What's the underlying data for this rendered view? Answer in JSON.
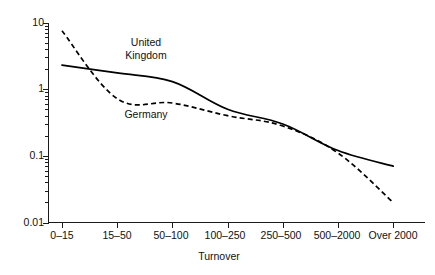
{
  "chart_data": {
    "type": "line",
    "title": "",
    "xlabel": "Turnover",
    "ylabel": "",
    "yscale": "log",
    "ylim": [
      0.01,
      10
    ],
    "grid": false,
    "legend": "inline-annotations",
    "categories": [
      "0–15",
      "15–50",
      "50–100",
      "100–250",
      "250–500",
      "500–2000",
      "Over\n2000"
    ],
    "ytick_labels": [
      "10",
      "1",
      "0.1",
      "0.01"
    ],
    "ytick_values": [
      10,
      1,
      0.1,
      0.01
    ],
    "series": [
      {
        "name": "United Kingdom",
        "style": "solid",
        "values": [
          2.3,
          1.75,
          1.3,
          0.5,
          0.3,
          0.12,
          0.07
        ]
      },
      {
        "name": "Germany",
        "style": "dashed",
        "values": [
          7.5,
          0.72,
          0.62,
          0.4,
          0.28,
          0.11,
          0.02
        ]
      }
    ],
    "annotations": [
      {
        "text": "United\nKingdom",
        "series": "United Kingdom"
      },
      {
        "text": "Germany",
        "series": "Germany"
      }
    ]
  },
  "axis": {
    "x_title": "Turnover",
    "x_categories": [
      "0–15",
      "15–50",
      "50–100",
      "100–250",
      "250–500",
      "500–2000",
      "Over\n2000"
    ],
    "y_ticks": [
      "10",
      "1",
      "0.1",
      "0.01"
    ]
  },
  "labels": {
    "uk": "United\nKingdom",
    "germany": "Germany"
  }
}
